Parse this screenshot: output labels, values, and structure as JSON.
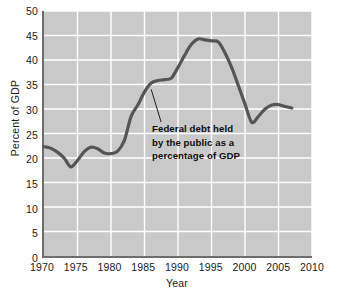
{
  "chart_data": {
    "type": "line",
    "title": "",
    "subtitle": "",
    "xlabel": "Year",
    "ylabel": "Percent of GDP",
    "xlim": [
      1970,
      2010
    ],
    "ylim": [
      0,
      50
    ],
    "xticks": [
      1970,
      1975,
      1980,
      1985,
      1990,
      1995,
      2000,
      2005,
      2010
    ],
    "yticks": [
      0,
      5,
      10,
      15,
      20,
      25,
      30,
      35,
      40,
      45,
      50
    ],
    "grid": true,
    "legend": "none",
    "plot_background_color": "#c9c9c9",
    "grid_color": "#ffffff",
    "axis_color": "#6d6d6d",
    "line_color": "#555555",
    "series": [
      {
        "name": "Federal debt held by the public as a percentage of GDP",
        "color": "#555555",
        "x": [
          1970,
          1971,
          1972,
          1973,
          1974,
          1975,
          1976,
          1977,
          1978,
          1979,
          1980,
          1981,
          1982,
          1983,
          1984,
          1985,
          1986,
          1987,
          1988,
          1989,
          1990,
          1991,
          1992,
          1993,
          1994,
          1995,
          1996,
          1997,
          1998,
          1999,
          2000,
          2001,
          2002,
          2003,
          2004,
          2005,
          2006,
          2007
        ],
        "values": [
          22.3,
          22.0,
          21.2,
          20.0,
          18.2,
          19.5,
          21.3,
          22.2,
          21.9,
          21.0,
          20.9,
          21.4,
          23.6,
          28.5,
          30.8,
          33.5,
          35.3,
          35.8,
          36.0,
          36.3,
          38.5,
          41.0,
          43.2,
          44.3,
          44.1,
          43.9,
          43.7,
          41.5,
          38.5,
          34.8,
          31.0,
          27.3,
          28.5,
          30.0,
          30.8,
          30.9,
          30.5,
          30.2
        ]
      }
    ],
    "annotations": [
      {
        "text_lines": [
          "Federal debt held",
          "by the public as a",
          "percentage of GDP"
        ],
        "points_to_year": 1986,
        "points_to_value": 34.0
      }
    ]
  }
}
